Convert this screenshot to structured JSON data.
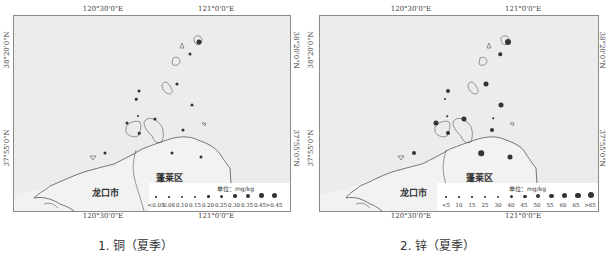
{
  "panels": [
    {
      "id": "cu",
      "caption": "1. 铜（夏季）",
      "axes": {
        "top_ticks": [
          "120°30'0\"E",
          "121°0'0\"E"
        ],
        "bottom_ticks": [
          "120°30'0\"E",
          "121°0'0\"E"
        ],
        "left_ticks": [
          "38°20'0\"N",
          "37°55'0\"N"
        ],
        "right_ticks": [
          "38°20'0\"N",
          "37°55'0\"N"
        ]
      },
      "places": [
        "蓬莱区",
        "龙口市"
      ],
      "legend": {
        "unit": "单位：mg/kg",
        "labels": [
          "<0.05",
          "0.08",
          "0.10",
          "0.15",
          "0.20",
          "0.25",
          "0.30",
          "0.35",
          "0.45",
          ">0.45"
        ]
      }
    },
    {
      "id": "zn",
      "caption": "2. 锌（夏季）",
      "axes": {
        "top_ticks": [
          "120°30'0\"E",
          "121°0'0\"E"
        ],
        "bottom_ticks": [
          "120°30'0\"E",
          "121°0'0\"E"
        ],
        "left_ticks": [
          "38°20'0\"N",
          "37°55'0\"N"
        ],
        "right_ticks": [
          "38°20'0\"N",
          "37°55'0\"N"
        ]
      },
      "places": [
        "蓬莱区",
        "龙口市"
      ],
      "legend": {
        "unit": "单位：mg/kg",
        "labels": [
          "<5",
          "10",
          "15",
          "25",
          "30",
          "40",
          "45",
          "50",
          "55",
          "60",
          "65",
          ">65"
        ]
      }
    }
  ],
  "colors": {
    "map_background": "#ececec",
    "frame": "#8a8a8a",
    "dot": "#333333",
    "coastline": "#555555"
  }
}
